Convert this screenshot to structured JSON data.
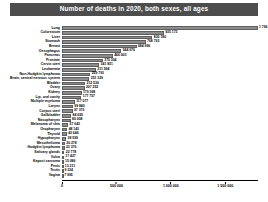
{
  "chart_data": {
    "type": "bar",
    "orientation": "horizontal",
    "title": "Number of deaths in 2020, both sexes, all ages",
    "xlabel": "",
    "ylabel": "",
    "xlim": [
      0,
      1800000
    ],
    "grid": false,
    "legend": null,
    "bar_color": "#8c8c8c",
    "title_banner_color": "#4d4d4d",
    "title_text_color": "#ffffff",
    "axis_tick_labels": [
      "0",
      "500 000",
      "1 000 000",
      "1 500 000"
    ],
    "axis_tick_values": [
      0,
      500000,
      1000000,
      1500000
    ],
    "categories": [
      "Lung",
      "Colorectum",
      "Liver",
      "Stomach",
      "Breast",
      "Oesophagus",
      "Pancreas",
      "Prostate",
      "Cervix uteri",
      "Leukaemia",
      "Non-Hodgkin lymphoma",
      "Brain, central nervous system",
      "Bladder",
      "Ovary",
      "Kidney",
      "Lip, oral cavity",
      "Multiple myeloma",
      "Larynx",
      "Corpus uteri",
      "Gallbladder",
      "Nasopharynx",
      "Melanoma of skin",
      "Oropharynx",
      "Thyroid",
      "Hypopharynx",
      "Mesothelioma",
      "Hodgkin lymphoma",
      "Salivary glands",
      "Vulva",
      "Kaposi sarcoma",
      "Penis",
      "Testis",
      "Vagina"
    ],
    "values": [
      1796144,
      935173,
      830180,
      768793,
      684996,
      544076,
      466003,
      375304,
      341831,
      311594,
      259793,
      251329,
      212536,
      207252,
      179368,
      177757,
      117077,
      99840,
      97370,
      84695,
      80008,
      57043,
      48143,
      43646,
      38599,
      26278,
      23376,
      22778,
      17427,
      15086,
      13211,
      9334,
      7995
    ],
    "value_labels": [
      "1 796 144",
      "935 173",
      "830 180",
      "768 793",
      "684 996",
      "544 076",
      "466 003",
      "375 304",
      "341 831",
      "311 594",
      "259 793",
      "251 329",
      "212 536",
      "207 252",
      "179 368",
      "177 757",
      "117 077",
      "99 840",
      "97 370",
      "84 695",
      "80 008",
      "57 043",
      "48 143",
      "43 646",
      "38 599",
      "26 278",
      "23 376",
      "22 778",
      "17 427",
      "15 086",
      "13 211",
      "9 334",
      "7 995"
    ]
  }
}
